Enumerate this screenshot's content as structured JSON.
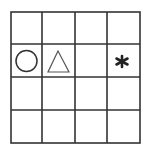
{
  "diagram": {
    "title": "",
    "rows": 4,
    "cols": 4,
    "line_color": "#333333",
    "cells": [
      {
        "row": 1,
        "col": 0,
        "symbol": "circle",
        "fill": "none",
        "stroke": "#333333"
      },
      {
        "row": 1,
        "col": 1,
        "symbol": "triangle",
        "fill": "none",
        "stroke": "#555555"
      },
      {
        "row": 1,
        "col": 2,
        "symbol": "empty"
      },
      {
        "row": 1,
        "col": 3,
        "symbol": "asterisk",
        "fill": "#222222"
      }
    ]
  }
}
